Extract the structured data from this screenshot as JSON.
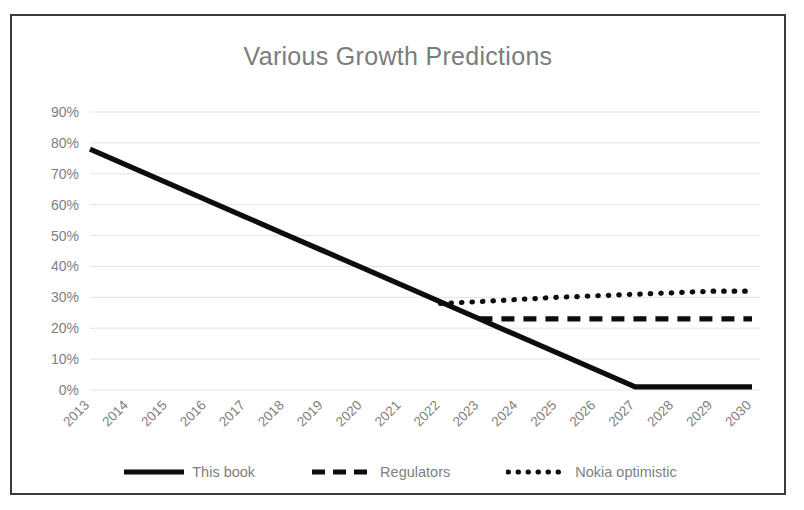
{
  "chart_data": {
    "type": "line",
    "title": "Various Growth Predictions",
    "xlabel": "",
    "ylabel": "",
    "ylim": [
      0,
      0.9
    ],
    "ytick_labels": [
      "0%",
      "10%",
      "20%",
      "30%",
      "40%",
      "50%",
      "60%",
      "70%",
      "80%",
      "90%"
    ],
    "ytick_values": [
      0,
      10,
      20,
      30,
      40,
      50,
      60,
      70,
      80,
      90
    ],
    "categories": [
      "2013",
      "2014",
      "2015",
      "2016",
      "2017",
      "2018",
      "2019",
      "2020",
      "2021",
      "2022",
      "2023",
      "2024",
      "2025",
      "2026",
      "2027",
      "2028",
      "2029",
      "2030"
    ],
    "grid": true,
    "legend_position": "bottom",
    "series": [
      {
        "name": "This book",
        "style": "solid",
        "color": "#0d0d0d",
        "values": [
          78,
          72.5,
          67,
          61.5,
          56,
          50.5,
          45,
          39.5,
          34,
          28.5,
          23,
          17.5,
          12,
          6.5,
          1,
          1,
          1,
          1
        ]
      },
      {
        "name": "Regulators",
        "style": "dashed",
        "color": "#0d0d0d",
        "values": [
          null,
          null,
          null,
          null,
          null,
          null,
          null,
          null,
          null,
          null,
          23,
          23,
          23,
          23,
          23,
          23,
          23,
          23
        ]
      },
      {
        "name": "Nokia optimistic",
        "style": "dotted",
        "color": "#0d0d0d",
        "values": [
          null,
          null,
          null,
          null,
          null,
          null,
          null,
          null,
          null,
          28,
          28.6,
          29.3,
          30,
          30.5,
          31,
          31.5,
          32,
          32
        ]
      }
    ]
  },
  "legend": {
    "items": [
      {
        "label": "This book",
        "marker": "solid-line-icon"
      },
      {
        "label": "Regulators",
        "marker": "dashed-line-icon"
      },
      {
        "label": "Nokia optimistic",
        "marker": "dotted-line-icon"
      }
    ]
  },
  "colors": {
    "series": "#0d0d0d",
    "grid": "#e3e3e3",
    "text": "#808080",
    "title": "#7c7c7c",
    "border": "#3a3a3c",
    "background": "#ffffff"
  }
}
